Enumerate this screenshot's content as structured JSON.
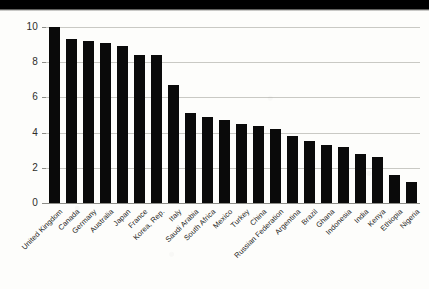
{
  "chart_data": {
    "type": "bar",
    "title": "",
    "subtitle": "",
    "xlabel": "",
    "ylabel": "",
    "ylim": [
      0,
      10
    ],
    "yticks": [
      0,
      2,
      4,
      6,
      8,
      10
    ],
    "ytick_labels": [
      "0",
      "2",
      "4",
      "6",
      "8",
      "10"
    ],
    "grid": true,
    "legend": "none",
    "bar_color": "#0a0a0a",
    "gridline_color": "#c9c9c4",
    "categories": [
      "United Kingdom",
      "Canada",
      "Germany",
      "Australia",
      "Japan",
      "France",
      "Korea, Rep.",
      "Italy",
      "Saudi Arabia",
      "South Africa",
      "Mexico",
      "Turkey",
      "China",
      "Russian Federation",
      "Argentina",
      "Brazil",
      "Ghana",
      "Indonesia",
      "India",
      "Kenya",
      "Ethiopia",
      "Nigeria"
    ],
    "values": [
      10.0,
      9.3,
      9.2,
      9.1,
      8.9,
      8.4,
      8.4,
      6.7,
      5.1,
      4.9,
      4.7,
      4.5,
      4.4,
      4.2,
      3.8,
      3.5,
      3.3,
      3.2,
      2.8,
      2.6,
      1.6,
      1.2
    ]
  }
}
